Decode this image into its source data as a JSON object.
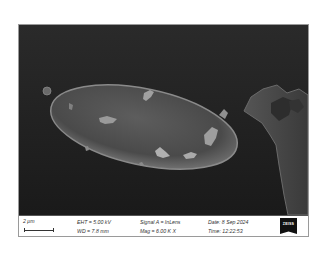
{
  "micrograph": {
    "subject": "ellipsoidal particle with surface debris, adjacent irregular structure",
    "view_background": "#1c1c1c"
  },
  "data_bar": {
    "scale_label": "2 μm",
    "eht": "EHT = 5.00 kV",
    "wd": "WD = 7.8 mm",
    "signal": "Signal A = InLens",
    "mag": "Mag = 6.00 K X",
    "date": "Date: 8 Sep 2024",
    "time": "Time: 12:22:53",
    "logo": "ZEISS"
  }
}
